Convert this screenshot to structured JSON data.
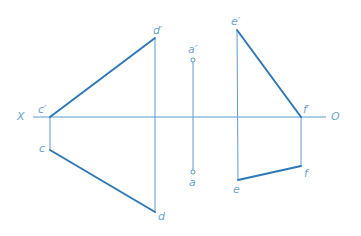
{
  "diagram": {
    "type": "orthographic-projection",
    "colors": {
      "thin_line": "#5a9ccc",
      "thick_line": "#2f78b8",
      "label": "#6aa4d0"
    },
    "axis": {
      "left_label": "X",
      "right_label": "O",
      "y": 117,
      "x1": 33,
      "x2": 326
    },
    "labels": {
      "X": "X",
      "O": "O",
      "c_prime": "c′",
      "d_prime": "d′",
      "c": "c",
      "d": "d",
      "a_prime": "a′",
      "a": "a",
      "e_prime": "e′",
      "f_prime": "f′",
      "e": "e",
      "f": "f"
    },
    "points": {
      "c_prime": [
        50,
        117
      ],
      "d_prime": [
        155,
        38
      ],
      "c": [
        50,
        150
      ],
      "d": [
        155,
        212
      ],
      "a_prime": [
        193,
        60
      ],
      "a": [
        193,
        172
      ],
      "e_prime": [
        237,
        30
      ],
      "f_prime": [
        301,
        117
      ],
      "e": [
        238,
        180
      ],
      "f": [
        301,
        166
      ]
    },
    "segments": {
      "cd_front": "c′d′ (thick)",
      "cd_top": "cd (thick)",
      "ef_front": "e′f′ (thick)",
      "ef_top": "ef (thick)"
    }
  }
}
